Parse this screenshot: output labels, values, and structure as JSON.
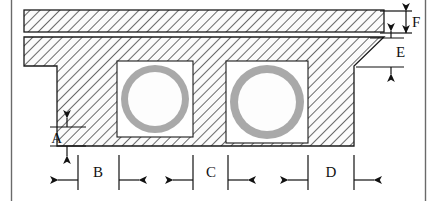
{
  "drawing": {
    "title": "Hollow-core slab / double-cell box girder cross-section",
    "type": "engineering-cross-section",
    "colors": {
      "outline": "#1a1a1a",
      "hatch": "#4a4a4a",
      "hatch_fill": "#fafafa",
      "pipe_ring": "#a8a8a8",
      "pipe_bore": "#ffffff",
      "void_box_fill": "#ffffff",
      "frame_border": "#555555",
      "dimension_line": "#111111",
      "label_text": "#111111"
    },
    "frame": {
      "left_border_x": 11,
      "right_border_x": 426
    },
    "parts": {
      "top_slab": {
        "name": "top-slab",
        "x": 24,
        "y": 10,
        "width": 360,
        "height": 22
      },
      "flange_slab": {
        "name": "flange-slab",
        "x": 24,
        "y": 37,
        "width": 360,
        "height": 29
      },
      "body": {
        "name": "girder-body",
        "x": 57,
        "y": 66,
        "width": 297,
        "height": 80
      }
    },
    "voids": [
      {
        "name": "void-cell-left",
        "box_x": 117,
        "box_y": 61,
        "box_w": 76,
        "box_h": 76,
        "cx": 155,
        "cy": 99,
        "r_outer": 34,
        "r_inner": 27
      },
      {
        "name": "void-cell-right",
        "box_x": 226,
        "box_y": 61,
        "box_w": 82,
        "box_h": 82,
        "cx": 267,
        "cy": 102,
        "r_outer": 37,
        "r_inner": 29
      }
    ]
  },
  "dimensions": {
    "A": {
      "label": "A",
      "orientation": "vertical",
      "arrows": "outward",
      "description": "bottom slab thickness"
    },
    "B": {
      "label": "B",
      "orientation": "horizontal",
      "arrows": "outward",
      "description": "left web width"
    },
    "C": {
      "label": "C",
      "orientation": "horizontal",
      "arrows": "outward",
      "description": "center web width"
    },
    "D": {
      "label": "D",
      "orientation": "horizontal",
      "arrows": "outward",
      "description": "right web width"
    },
    "E": {
      "label": "E",
      "orientation": "vertical",
      "arrows": "inward",
      "description": "flange slab thickness"
    },
    "F": {
      "label": "F",
      "orientation": "vertical",
      "arrows": "inward",
      "description": "top slab thickness"
    }
  }
}
